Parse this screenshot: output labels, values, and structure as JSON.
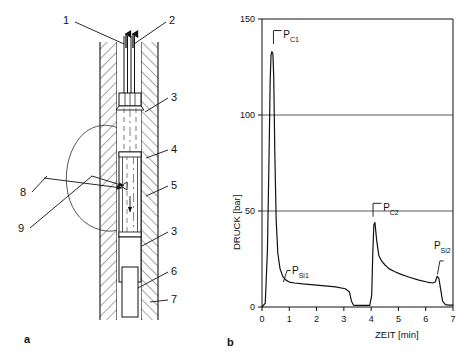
{
  "figure": {
    "panel_a_letter": "a",
    "panel_b_letter": "b"
  },
  "diagram": {
    "title_absent": "",
    "callouts": [
      {
        "id": "1",
        "label": "1"
      },
      {
        "id": "2",
        "label": "2"
      },
      {
        "id": "3a",
        "label": "3"
      },
      {
        "id": "4",
        "label": "4"
      },
      {
        "id": "5",
        "label": "5"
      },
      {
        "id": "3b",
        "label": "3"
      },
      {
        "id": "6",
        "label": "6"
      },
      {
        "id": "7",
        "label": "7"
      },
      {
        "id": "8",
        "label": "8"
      },
      {
        "id": "9",
        "label": "9"
      }
    ]
  },
  "chart_data": {
    "type": "line",
    "title": "",
    "xlabel": "ZEIT [min]",
    "ylabel": "DRUCK [bar]",
    "xlim": [
      0,
      7
    ],
    "ylim": [
      0,
      150
    ],
    "xticks": [
      "0",
      "1",
      "2",
      "3",
      "4",
      "5",
      "6",
      "7"
    ],
    "yticks": [
      "0",
      "50",
      "100",
      "150"
    ],
    "grid": "horizontal gridlines at 50 and 100; frame top at 150",
    "legend_position": "none",
    "annotations": [
      {
        "name": "P_C1",
        "base": "P",
        "sub": "C1",
        "x": 0.42,
        "y": 133
      },
      {
        "name": "P_Si1",
        "base": "P",
        "sub": "Si1",
        "x": 0.95,
        "y": 13
      },
      {
        "name": "P_C2",
        "base": "P",
        "sub": "C2",
        "x": 4.35,
        "y": 44
      },
      {
        "name": "P_Si2",
        "base": "P",
        "sub": "Si2",
        "x": 6.55,
        "y": 16
      }
    ],
    "series": [
      {
        "name": "Druckverlauf",
        "x": [
          0.0,
          0.12,
          0.2,
          0.26,
          0.3,
          0.33,
          0.36,
          0.4,
          0.43,
          0.47,
          0.52,
          0.58,
          0.66,
          0.76,
          0.88,
          1.0,
          1.2,
          1.5,
          1.9,
          2.3,
          2.7,
          3.05,
          3.2,
          3.28,
          3.35,
          3.45,
          3.7,
          3.95,
          4.02,
          4.06,
          4.1,
          4.14,
          4.2,
          4.28,
          4.38,
          4.5,
          4.65,
          4.85,
          5.1,
          5.4,
          5.75,
          6.05,
          6.25,
          6.35,
          6.42,
          6.48,
          6.55,
          6.62,
          6.72,
          6.85,
          7.0
        ],
        "y": [
          0,
          2,
          30,
          80,
          118,
          131,
          133,
          132,
          120,
          80,
          45,
          28,
          20,
          16,
          14,
          13,
          12.5,
          12,
          11.5,
          11,
          10.5,
          9.5,
          8,
          3,
          1,
          0.8,
          0.8,
          0.8,
          6,
          28,
          43,
          44,
          35,
          27,
          24,
          22,
          20,
          18.5,
          17,
          15.5,
          14,
          13,
          12.5,
          13,
          16,
          15,
          9,
          3,
          1.2,
          1,
          1
        ]
      }
    ]
  }
}
